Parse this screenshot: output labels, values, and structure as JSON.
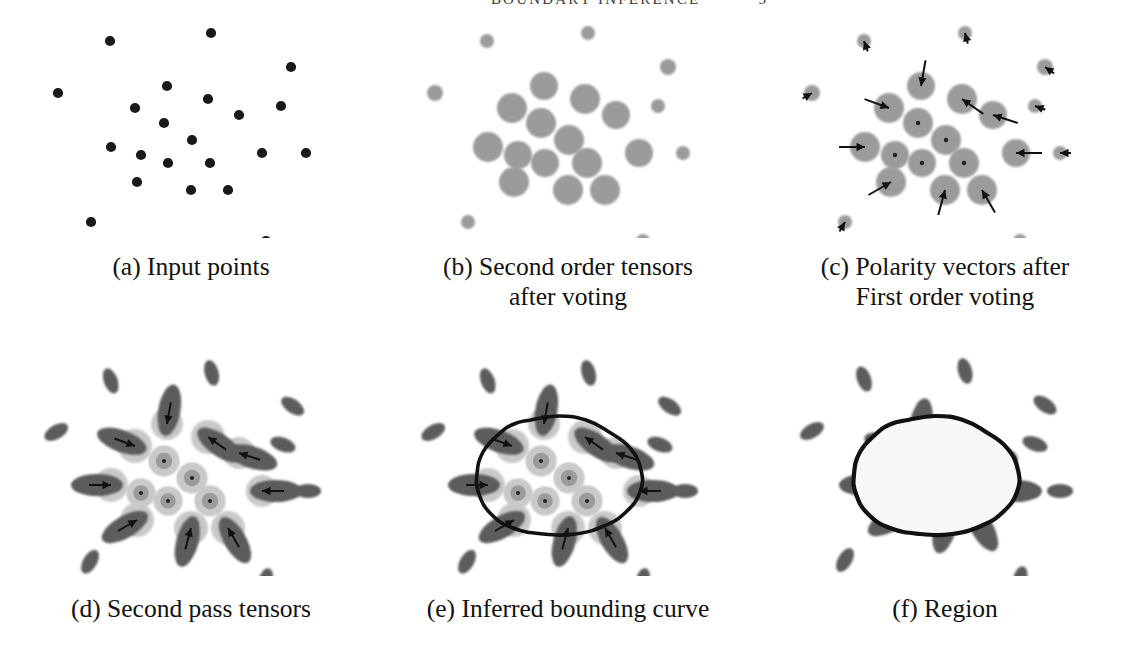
{
  "running_head": {
    "title": "BOUNDARY INFERENCE",
    "page": "5"
  },
  "figure": {
    "panels": [
      {
        "id": "a",
        "caption_lines": [
          "(a) Input points"
        ]
      },
      {
        "id": "b",
        "caption_lines": [
          "(b) Second order tensors",
          "after voting"
        ]
      },
      {
        "id": "c",
        "caption_lines": [
          "(c) Polarity vectors after",
          "First order voting"
        ]
      },
      {
        "id": "d",
        "caption_lines": [
          "(d) Second pass tensors"
        ]
      },
      {
        "id": "e",
        "caption_lines": [
          "(e) Inferred bounding curve"
        ]
      },
      {
        "id": "f",
        "caption_lines": [
          "(f) Region"
        ]
      }
    ]
  },
  "colors": {
    "point_black": "#1a1a1a",
    "ball_gray": "#9b9b9b",
    "ball_gray_light": "#c9c9c9",
    "stick_dark": "#5c5c5c",
    "curve_black": "#111111",
    "region_fill": "#f7f7f7",
    "background": "#ffffff"
  },
  "chart_data": {
    "type": "scatter",
    "xlabel": "",
    "ylabel": "",
    "xlim": [
      0,
      370
    ],
    "ylim": [
      0,
      228
    ],
    "grid": false,
    "legend": "none",
    "point_roles": {
      "interior": "inside the inferred region - large ball tensors, no polarity arrow at final stage",
      "boundary": "on the inferred curve - strong stick tensors with inward polarity arrows",
      "outer": "isolated outliers - small tensors, weak/absent arrows"
    },
    "points": [
      {
        "id": 1,
        "x": 104,
        "y": 31,
        "role": "outer",
        "r_b": 7,
        "r_d": 8,
        "angle": 250
      },
      {
        "id": 2,
        "x": 205,
        "y": 23,
        "role": "outer",
        "r_b": 7,
        "r_d": 8,
        "angle": 255
      },
      {
        "id": 3,
        "x": 285,
        "y": 57,
        "role": "outer",
        "r_b": 8,
        "r_d": 9,
        "angle": 215
      },
      {
        "id": 4,
        "x": 52,
        "y": 83,
        "role": "outer",
        "r_b": 8,
        "r_d": 9,
        "angle": 330
      },
      {
        "id": 5,
        "x": 161,
        "y": 76,
        "role": "boundary",
        "r_b": 14,
        "r_d": 16,
        "angle": 100
      },
      {
        "id": 6,
        "x": 202,
        "y": 89,
        "role": "boundary",
        "r_b": 15,
        "r_d": 17,
        "angle": 215
      },
      {
        "id": 7,
        "x": 129,
        "y": 98,
        "role": "boundary",
        "r_b": 15,
        "r_d": 17,
        "angle": 20
      },
      {
        "id": 8,
        "x": 233,
        "y": 105,
        "role": "boundary",
        "r_b": 14,
        "r_d": 16,
        "angle": 198
      },
      {
        "id": 9,
        "x": 158,
        "y": 113,
        "role": "interior",
        "r_b": 15,
        "r_d": 15,
        "angle": null
      },
      {
        "id": 10,
        "x": 186,
        "y": 130,
        "role": "interior",
        "r_b": 15,
        "r_d": 15,
        "angle": null
      },
      {
        "id": 11,
        "x": 105,
        "y": 137,
        "role": "boundary",
        "r_b": 15,
        "r_d": 17,
        "angle": 0
      },
      {
        "id": 12,
        "x": 135,
        "y": 145,
        "role": "interior",
        "r_b": 14,
        "r_d": 14,
        "angle": null
      },
      {
        "id": 13,
        "x": 256,
        "y": 143,
        "role": "boundary",
        "r_b": 14,
        "r_d": 16,
        "angle": 180
      },
      {
        "id": 14,
        "x": 162,
        "y": 153,
        "role": "interior",
        "r_b": 14,
        "r_d": 14,
        "angle": null
      },
      {
        "id": 15,
        "x": 204,
        "y": 153,
        "role": "interior",
        "r_b": 15,
        "r_d": 15,
        "angle": null
      },
      {
        "id": 16,
        "x": 131,
        "y": 172,
        "role": "boundary",
        "r_b": 15,
        "r_d": 17,
        "angle": 330
      },
      {
        "id": 17,
        "x": 185,
        "y": 180,
        "role": "boundary",
        "r_b": 15,
        "r_d": 17,
        "angle": 285
      },
      {
        "id": 18,
        "x": 222,
        "y": 180,
        "role": "boundary",
        "r_b": 15,
        "r_d": 17,
        "angle": 240
      },
      {
        "id": 19,
        "x": 300,
        "y": 143,
        "role": "outer",
        "r_b": 7,
        "r_d": 9,
        "angle": 180
      },
      {
        "id": 20,
        "x": 85,
        "y": 212,
        "role": "outer",
        "r_b": 7,
        "r_d": 9,
        "angle": 300
      },
      {
        "id": 21,
        "x": 260,
        "y": 231,
        "role": "outer",
        "r_b": 7,
        "r_d": 9,
        "angle": 285
      },
      {
        "id": 22,
        "x": 275,
        "y": 96,
        "role": "outer",
        "r_b": 7,
        "r_d": 9,
        "angle": 200
      }
    ],
    "bounding_curve": [
      [
        148,
        72
      ],
      [
        176,
        68
      ],
      [
        203,
        72
      ],
      [
        226,
        84
      ],
      [
        247,
        100
      ],
      [
        258,
        122
      ],
      [
        257,
        144
      ],
      [
        243,
        164
      ],
      [
        221,
        178
      ],
      [
        192,
        186
      ],
      [
        160,
        186
      ],
      [
        130,
        180
      ],
      [
        108,
        166
      ],
      [
        96,
        146
      ],
      [
        94,
        126
      ],
      [
        100,
        104
      ],
      [
        116,
        86
      ],
      [
        131,
        76
      ]
    ]
  }
}
